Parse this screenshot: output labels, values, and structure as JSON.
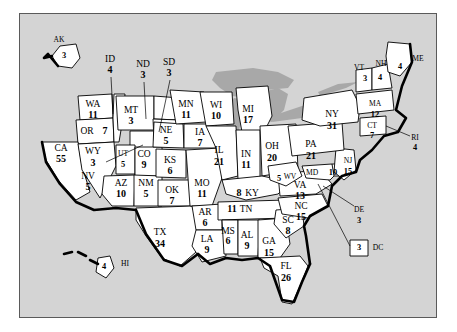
{
  "figure": {
    "panel_bg": "#d4d4d4",
    "state_fill": "#ffffff",
    "lake_fill": "#a8a8a8",
    "outline": "#000000"
  },
  "chart_data": {
    "type": "map",
    "unit": "electoral votes",
    "total": 538,
    "categories": [
      "AK",
      "HI",
      "WA",
      "OR",
      "CA",
      "NV",
      "ID",
      "MT",
      "WY",
      "UT",
      "AZ",
      "NM",
      "CO",
      "ND",
      "SD",
      "NE",
      "KS",
      "OK",
      "TX",
      "MN",
      "IA",
      "MO",
      "AR",
      "LA",
      "WI",
      "IL",
      "MI",
      "IN",
      "OH",
      "KY",
      "TN",
      "MS",
      "AL",
      "GA",
      "FL",
      "SC",
      "NC",
      "VA",
      "WV",
      "MD",
      "DE",
      "NJ",
      "PA",
      "NY",
      "CT",
      "RI",
      "MA",
      "VT",
      "NH",
      "ME",
      "DC"
    ],
    "values": [
      3,
      4,
      11,
      7,
      55,
      5,
      4,
      3,
      3,
      5,
      10,
      5,
      9,
      3,
      3,
      5,
      6,
      7,
      34,
      11,
      7,
      11,
      6,
      9,
      10,
      21,
      17,
      11,
      20,
      8,
      11,
      6,
      9,
      15,
      26,
      8,
      15,
      13,
      5,
      10,
      3,
      15,
      21,
      31,
      7,
      4,
      12,
      3,
      4,
      4,
      3
    ],
    "states": [
      {
        "code": "AK",
        "votes": 3,
        "label_x": 39,
        "label_y": 26,
        "num_x": 44,
        "num_y": 42,
        "inset": true
      },
      {
        "code": "HI",
        "votes": 4,
        "label_x": 105,
        "label_y": 250,
        "num_x": 84,
        "num_y": 253,
        "inset": true
      },
      {
        "code": "WA",
        "votes": 11,
        "label_x": 73,
        "label_y": 91,
        "num_x": 73,
        "num_y": 102
      },
      {
        "code": "OR",
        "votes": 7,
        "label_x": 67,
        "label_y": 118,
        "num_x": 85,
        "num_y": 118,
        "inline": true
      },
      {
        "code": "CA",
        "votes": 55,
        "label_x": 41,
        "label_y": 135,
        "num_x": 41,
        "num_y": 146
      },
      {
        "code": "NV",
        "votes": 5,
        "label_x": 68,
        "label_y": 163,
        "num_x": 68,
        "num_y": 174
      },
      {
        "code": "ID",
        "votes": 4,
        "label_x": 90,
        "label_y": 46,
        "num_x": 90,
        "num_y": 57,
        "leader": [
          91,
          63,
          93,
          100
        ]
      },
      {
        "code": "MT",
        "votes": 3,
        "label_x": 111,
        "label_y": 97,
        "num_x": 111,
        "num_y": 108
      },
      {
        "code": "WY",
        "votes": 3,
        "label_x": 73,
        "label_y": 138,
        "num_x": 73,
        "num_y": 150,
        "leader": [
          86,
          148,
          123,
          131
        ]
      },
      {
        "code": "UT",
        "votes": 5,
        "label_x": 103,
        "label_y": 140,
        "num_x": 103,
        "num_y": 151
      },
      {
        "code": "AZ",
        "votes": 10,
        "label_x": 101,
        "label_y": 170,
        "num_x": 101,
        "num_y": 181
      },
      {
        "code": "NM",
        "votes": 5,
        "label_x": 126,
        "label_y": 170,
        "num_x": 126,
        "num_y": 181
      },
      {
        "code": "CO",
        "votes": 9,
        "label_x": 124,
        "label_y": 141,
        "num_x": 124,
        "num_y": 152
      },
      {
        "code": "ND",
        "votes": 3,
        "label_x": 123,
        "label_y": 51,
        "num_x": 123,
        "num_y": 62,
        "leader": [
          124,
          68,
          126,
          105
        ]
      },
      {
        "code": "SD",
        "votes": 3,
        "label_x": 149,
        "label_y": 49,
        "num_x": 149,
        "num_y": 60,
        "leader": [
          150,
          66,
          139,
          118
        ]
      },
      {
        "code": "NE",
        "votes": 5,
        "label_x": 146,
        "label_y": 117,
        "num_x": 146,
        "num_y": 128
      },
      {
        "code": "KS",
        "votes": 6,
        "label_x": 150,
        "label_y": 147,
        "num_x": 150,
        "num_y": 158
      },
      {
        "code": "OK",
        "votes": 7,
        "label_x": 152,
        "label_y": 177,
        "num_x": 152,
        "num_y": 188
      },
      {
        "code": "TX",
        "votes": 34,
        "label_x": 140,
        "label_y": 219,
        "num_x": 140,
        "num_y": 231
      },
      {
        "code": "MN",
        "votes": 11,
        "label_x": 166,
        "label_y": 91,
        "num_x": 166,
        "num_y": 102
      },
      {
        "code": "IA",
        "votes": 7,
        "label_x": 180,
        "label_y": 119,
        "num_x": 180,
        "num_y": 130
      },
      {
        "code": "MO",
        "votes": 11,
        "label_x": 182,
        "label_y": 170,
        "num_x": 182,
        "num_y": 181
      },
      {
        "code": "AR",
        "votes": 6,
        "label_x": 185,
        "label_y": 199,
        "num_x": 185,
        "num_y": 210
      },
      {
        "code": "LA",
        "votes": 9,
        "label_x": 187,
        "label_y": 226,
        "num_x": 187,
        "num_y": 237
      },
      {
        "code": "WI",
        "votes": 10,
        "label_x": 196,
        "label_y": 92,
        "num_x": 196,
        "num_y": 103
      },
      {
        "code": "IL",
        "votes": 21,
        "label_x": 199,
        "label_y": 137,
        "num_x": 199,
        "num_y": 149
      },
      {
        "code": "MI",
        "votes": 17,
        "label_x": 228,
        "label_y": 96,
        "num_x": 228,
        "num_y": 107
      },
      {
        "code": "IN",
        "votes": 11,
        "label_x": 226,
        "label_y": 141,
        "num_x": 226,
        "num_y": 152
      },
      {
        "code": "OH",
        "votes": 20,
        "label_x": 252,
        "label_y": 133,
        "num_x": 252,
        "num_y": 145
      },
      {
        "code": "KY",
        "votes": 8,
        "label_x": 232,
        "label_y": 180,
        "num_x": 219,
        "num_y": 180,
        "inline": true
      },
      {
        "code": "TN",
        "votes": 11,
        "label_x": 226,
        "label_y": 196,
        "num_x": 212,
        "num_y": 196,
        "inline": true
      },
      {
        "code": "MS",
        "votes": 6,
        "label_x": 208,
        "label_y": 218,
        "num_x": 208,
        "num_y": 228
      },
      {
        "code": "AL",
        "votes": 9,
        "label_x": 227,
        "label_y": 222,
        "num_x": 227,
        "num_y": 233
      },
      {
        "code": "GA",
        "votes": 15,
        "label_x": 249,
        "label_y": 228,
        "num_x": 249,
        "num_y": 240
      },
      {
        "code": "FL",
        "votes": 26,
        "label_x": 266,
        "label_y": 253,
        "num_x": 266,
        "num_y": 265
      },
      {
        "code": "SC",
        "votes": 8,
        "label_x": 268,
        "label_y": 207,
        "num_x": 268,
        "num_y": 218
      },
      {
        "code": "NC",
        "votes": 15,
        "label_x": 281,
        "label_y": 193,
        "num_x": 281,
        "num_y": 204
      },
      {
        "code": "VA",
        "votes": 13,
        "label_x": 280,
        "label_y": 172,
        "num_x": 280,
        "num_y": 183
      },
      {
        "code": "WV",
        "votes": 5,
        "label_x": 270,
        "label_y": 163,
        "num_x": 259,
        "num_y": 165,
        "inline": true
      },
      {
        "code": "MD",
        "votes": 10,
        "label_x": 292,
        "label_y": 159,
        "num_x": 313,
        "num_y": 159,
        "inline": true
      },
      {
        "code": "DE",
        "votes": 3,
        "label_x": 339,
        "label_y": 196,
        "num_x": 339,
        "num_y": 207,
        "leader": [
          334,
          192,
          303,
          172
        ]
      },
      {
        "code": "NJ",
        "votes": 15,
        "label_x": 328,
        "label_y": 147,
        "num_x": 328,
        "num_y": 158
      },
      {
        "code": "PA",
        "votes": 21,
        "label_x": 291,
        "label_y": 131,
        "num_x": 291,
        "num_y": 143
      },
      {
        "code": "NY",
        "votes": 31,
        "label_x": 312,
        "label_y": 101,
        "num_x": 312,
        "num_y": 113
      },
      {
        "code": "CT",
        "votes": 7,
        "label_x": 352,
        "label_y": 112,
        "num_x": 352,
        "num_y": 122
      },
      {
        "code": "RI",
        "votes": 4,
        "label_x": 395,
        "label_y": 124,
        "num_x": 395,
        "num_y": 134,
        "leader": [
          390,
          122,
          366,
          112
        ]
      },
      {
        "code": "MA",
        "votes": 12,
        "label_x": 355,
        "label_y": 90,
        "num_x": 355,
        "num_y": 101
      },
      {
        "code": "VT",
        "votes": 3,
        "label_x": 339,
        "label_y": 54,
        "num_x": 345,
        "num_y": 65
      },
      {
        "code": "NH",
        "votes": 4,
        "label_x": 361,
        "label_y": 50,
        "num_x": 360,
        "num_y": 64
      },
      {
        "code": "ME",
        "votes": 4,
        "label_x": 398,
        "label_y": 45,
        "num_x": 380,
        "num_y": 53
      },
      {
        "code": "DC",
        "votes": 3,
        "label_x": 358,
        "label_y": 234,
        "num_x": 339,
        "num_y": 234,
        "inline": true,
        "leader": [
          330,
          232,
          298,
          170
        ]
      }
    ]
  }
}
